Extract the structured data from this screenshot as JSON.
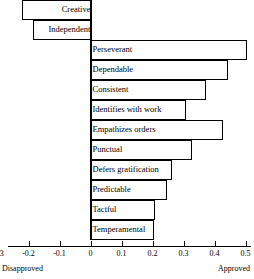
{
  "chart_data": {
    "type": "bar",
    "orientation": "horizontal",
    "title": "",
    "subtitle": "",
    "xlabel": "",
    "ylabel": "",
    "xlim": [
      -0.3,
      0.55
    ],
    "grid": false,
    "legend": null,
    "axis_end_labels": {
      "left": "Disapproved",
      "right": "Approved"
    },
    "xticks": [
      -0.3,
      -0.2,
      -0.1,
      0,
      0.1,
      0.2,
      0.3,
      0.4,
      0.5
    ],
    "xticklabels": [
      "-0.3",
      "-0.2",
      "-0.1",
      "0",
      "0.1",
      "0.2",
      "0.3",
      "0.4",
      "0.5"
    ],
    "categories": [
      "Creative",
      "Independent",
      "Perseverant",
      "Dependable",
      "Consistent",
      "Identifies with work",
      "Empathizes orders",
      "Punctual",
      "Defers gratification",
      "Predictable",
      "Tactful",
      "Temperamental"
    ],
    "values": [
      -0.22,
      -0.185,
      0.5,
      0.44,
      0.37,
      0.305,
      0.425,
      0.325,
      0.26,
      0.245,
      0.205,
      0.2
    ],
    "bars": [
      {
        "label": "Creative",
        "value": -0.22
      },
      {
        "label": "Independent",
        "value": -0.185
      },
      {
        "label": "Perseverant",
        "value": 0.5
      },
      {
        "label": "Dependable",
        "value": 0.44
      },
      {
        "label": "Consistent",
        "value": 0.37
      },
      {
        "label": "Identifies with work",
        "value": 0.305
      },
      {
        "label": "Empathizes orders",
        "value": 0.425
      },
      {
        "label": "Punctual",
        "value": 0.325
      },
      {
        "label": "Defers gratification",
        "value": 0.26
      },
      {
        "label": "Predictable",
        "value": 0.245
      },
      {
        "label": "Tactful",
        "value": 0.205
      },
      {
        "label": "Temperamental",
        "value": 0.2
      }
    ],
    "colors": {
      "bar_fill": "#ffffff",
      "bar_stroke": "#000000",
      "axis": "#000000",
      "text": "#000000",
      "background": "#ffffff"
    }
  }
}
